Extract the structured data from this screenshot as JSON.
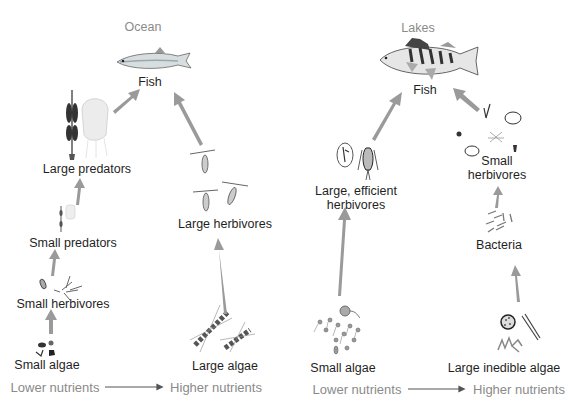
{
  "panels": {
    "ocean": {
      "title": "Ocean",
      "nodes": {
        "fish": "Fish",
        "large_predators": "Large predators",
        "small_predators": "Small predators",
        "small_herbivores": "Small herbivores",
        "small_algae": "Small algae",
        "large_herbivores": "Large herbivores",
        "large_algae": "Large algae"
      },
      "axis": {
        "low": "Lower nutrients",
        "high": "Higher nutrients"
      }
    },
    "lakes": {
      "title": "Lakes",
      "nodes": {
        "fish": "Fish",
        "large_efficient_herbivores_1": "Large, efficient",
        "large_efficient_herbivores_2": "herbivores",
        "small_algae": "Small algae",
        "small_herbivores_1": "Small",
        "small_herbivores_2": "herbivores",
        "bacteria": "Bacteria",
        "large_inedible_algae": "Large inedible algae"
      },
      "axis": {
        "low": "Lower nutrients",
        "high": "Higher nutrients"
      }
    }
  },
  "colors": {
    "arrow": "#9a9a9a",
    "text": "#1f1f1f",
    "muted_text": "#8a8a8a",
    "axis_arrow": "#555555"
  }
}
